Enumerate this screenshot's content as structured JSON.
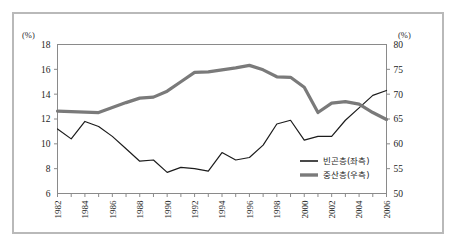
{
  "figure": {
    "left_axis_unit": "(%)",
    "right_axis_unit": "(%)"
  },
  "chart_data": {
    "type": "line",
    "title": "",
    "xlabel": "",
    "ylabel": "",
    "grid": false,
    "legend_position": "inside-right-bottom",
    "x": [
      1982,
      1983,
      1984,
      1985,
      1986,
      1987,
      1988,
      1989,
      1990,
      1991,
      1992,
      1993,
      1994,
      1995,
      1996,
      1997,
      1998,
      1999,
      2000,
      2001,
      2002,
      2003,
      2004,
      2005,
      2006
    ],
    "xlim": [
      1982,
      2006
    ],
    "xtick_labels": [
      "1982",
      "1984",
      "1986",
      "1988",
      "1990",
      "1992",
      "1994",
      "1996",
      "1998",
      "2000",
      "2002",
      "2004",
      "2006"
    ],
    "xtick_values": [
      1982,
      1984,
      1986,
      1988,
      1990,
      1992,
      1994,
      1996,
      1998,
      2000,
      2002,
      2004,
      2006
    ],
    "left_axis": {
      "unit": "(%)",
      "ylim": [
        6,
        18
      ],
      "ticks": [
        6,
        8,
        10,
        12,
        14,
        16,
        18
      ],
      "tick_labels": [
        "6",
        "8",
        "10",
        "12",
        "14",
        "16",
        "18"
      ]
    },
    "right_axis": {
      "unit": "(%)",
      "ylim": [
        50,
        80
      ],
      "ticks": [
        50,
        55,
        60,
        65,
        70,
        75,
        80
      ],
      "tick_labels": [
        "50",
        "55",
        "60",
        "65",
        "70",
        "75",
        "80"
      ]
    },
    "series": [
      {
        "name": "빈곤층(좌측)",
        "axis": "left",
        "color": "#1c1c1c",
        "width": 1.2,
        "values": [
          11.2,
          10.4,
          11.8,
          11.4,
          10.6,
          9.6,
          8.6,
          8.7,
          7.7,
          8.1,
          8.0,
          7.8,
          9.3,
          8.7,
          8.9,
          9.9,
          11.6,
          11.9,
          10.3,
          10.6,
          10.6,
          11.9,
          12.9,
          13.9,
          14.3
        ]
      },
      {
        "name": "중산층(우측)",
        "axis": "right",
        "color": "#7a7a7a",
        "width": 3.2,
        "values": [
          66.6,
          66.5,
          66.4,
          66.3,
          67.3,
          68.3,
          69.2,
          69.4,
          70.6,
          72.5,
          74.4,
          74.5,
          74.9,
          75.3,
          75.8,
          74.9,
          73.5,
          73.4,
          71.4,
          66.3,
          68.2,
          68.5,
          68.0,
          66.3,
          64.9
        ]
      }
    ],
    "legend": [
      {
        "label": "빈곤층(좌측)",
        "color": "#1c1c1c",
        "width": 1.6
      },
      {
        "label": "중산층(우측)",
        "color": "#7a7a7a",
        "width": 3.4
      }
    ]
  }
}
